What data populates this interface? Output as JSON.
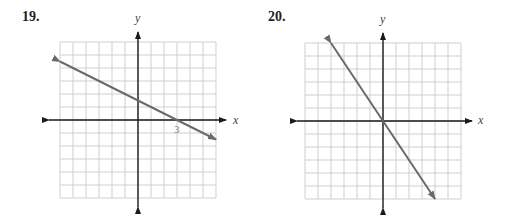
{
  "chart_data": [
    {
      "type": "line",
      "title": "19.",
      "xlabel": "x",
      "ylabel": "y",
      "xlim": [
        -6,
        6
      ],
      "ylim": [
        -6,
        6
      ],
      "grid": true,
      "grid_step": 1,
      "tick_labels": [
        {
          "axis": "x",
          "value": 3,
          "text": "3"
        }
      ],
      "series": [
        {
          "name": "line",
          "equation": "y = -0.5x + 1.5",
          "slope": -0.5,
          "intercept": 1.5,
          "x": [
            -6,
            6
          ],
          "y": [
            4.5,
            -1.5
          ],
          "arrows_both_ends": true
        }
      ],
      "color": "#6a6a6a"
    },
    {
      "type": "line",
      "title": "20.",
      "xlabel": "x",
      "ylabel": "y",
      "xlim": [
        -6,
        6
      ],
      "ylim": [
        -6,
        6
      ],
      "grid": true,
      "grid_step": 1,
      "tick_labels": [],
      "series": [
        {
          "name": "line",
          "equation": "y = -1.5x",
          "slope": -1.5,
          "intercept": 0,
          "x": [
            -4,
            4
          ],
          "y": [
            6,
            -6
          ],
          "arrows_both_ends": true
        }
      ],
      "color": "#6a6a6a"
    }
  ],
  "graphs": [
    {
      "number": "19.",
      "x_label": "x",
      "y_label": "y",
      "tick_3": "3"
    },
    {
      "number": "20.",
      "x_label": "x",
      "y_label": "y"
    }
  ]
}
